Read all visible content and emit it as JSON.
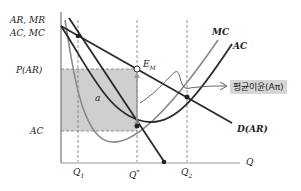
{
  "axes": {
    "y_label_line1": "AR, MR",
    "y_label_line2": "AC, MC",
    "x_label": "Q"
  },
  "y_ticks": {
    "price": "P(AR)",
    "ac": "AC"
  },
  "x_ticks": {
    "q1": "Q",
    "q1_sub": "1",
    "qstar": "Q",
    "qstar_sup": "*",
    "q2": "Q",
    "q2_sub": "2"
  },
  "curves": {
    "mc": "MC",
    "ac": "AC",
    "demand": "D(AR)"
  },
  "annotations": {
    "equilibrium": "E",
    "equilibrium_sub": "M",
    "area": "a",
    "avg_profit": "평균이윤(Aπ)"
  },
  "colors": {
    "shade": "#cfcfcf",
    "dark_curve": "#2a2a2a",
    "gray_curve": "#8a8a8a",
    "badge_bg": "#d6d6d6"
  }
}
